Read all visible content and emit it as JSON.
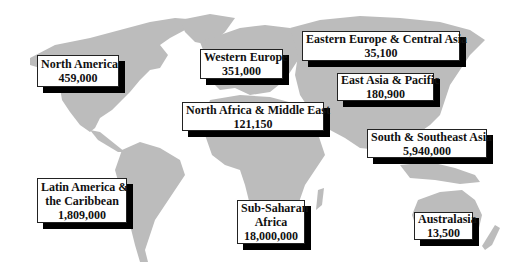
{
  "map": {
    "land_color": "#bcbcbc",
    "background_color": "#ffffff",
    "label_shadow_color": "#000000"
  },
  "regions": [
    {
      "id": "north-america",
      "name_lines": [
        "North America"
      ],
      "value": "459,000"
    },
    {
      "id": "western-europe",
      "name_lines": [
        "Western Europe"
      ],
      "value": "351,000"
    },
    {
      "id": "eastern-europe-central-asia",
      "name_lines": [
        "Eastern Europe & Central Asia"
      ],
      "value": "35,100"
    },
    {
      "id": "east-asia-pacific",
      "name_lines": [
        "East Asia & Pacific"
      ],
      "value": "180,900"
    },
    {
      "id": "north-africa-middle-east",
      "name_lines": [
        "North Africa & Middle East"
      ],
      "value": "121,150"
    },
    {
      "id": "south-southeast-asia",
      "name_lines": [
        "South & Southeast Asia"
      ],
      "value": "5,940,000"
    },
    {
      "id": "latin-america-caribbean",
      "name_lines": [
        "Latin America &",
        "the Caribbean"
      ],
      "value": "1,809,000"
    },
    {
      "id": "sub-saharan-africa",
      "name_lines": [
        "Sub-Saharan",
        "Africa"
      ],
      "value": "18,000,000"
    },
    {
      "id": "australasia",
      "name_lines": [
        "Australasia"
      ],
      "value": "13,500"
    }
  ]
}
